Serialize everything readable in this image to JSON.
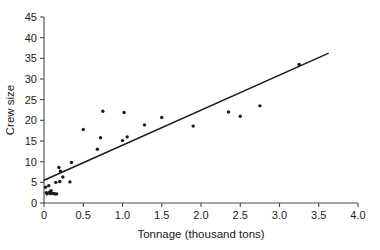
{
  "chart_data": {
    "type": "scatter",
    "title": "",
    "xlabel": "Tonnage (thousand tons)",
    "ylabel": "Crew size",
    "xlim": [
      0,
      4.0
    ],
    "ylim": [
      0,
      45
    ],
    "xticks": [
      0,
      0.5,
      1.0,
      1.5,
      2.0,
      2.5,
      3.0,
      3.5,
      4.0
    ],
    "xticklabels": [
      "0",
      "0.5",
      "1.0",
      "1.5",
      "2.0",
      "2.5",
      "3.0",
      "3.5",
      "4.0"
    ],
    "yticks": [
      0,
      5,
      10,
      15,
      20,
      25,
      30,
      35,
      40,
      45
    ],
    "yticklabels": [
      "0",
      "5",
      "10",
      "15",
      "20",
      "25",
      "30",
      "35",
      "40",
      "45"
    ],
    "grid": false,
    "legend": false,
    "points": [
      [
        0.02,
        3.8
      ],
      [
        0.03,
        2.5
      ],
      [
        0.04,
        2.2
      ],
      [
        0.06,
        4.2
      ],
      [
        0.07,
        2.6
      ],
      [
        0.08,
        2.3
      ],
      [
        0.09,
        3.0
      ],
      [
        0.1,
        2.4
      ],
      [
        0.12,
        2.3
      ],
      [
        0.14,
        2.2
      ],
      [
        0.15,
        5.0
      ],
      [
        0.16,
        2.2
      ],
      [
        0.19,
        8.6
      ],
      [
        0.2,
        5.2
      ],
      [
        0.21,
        7.7
      ],
      [
        0.24,
        6.3
      ],
      [
        0.33,
        5.1
      ],
      [
        0.35,
        9.8
      ],
      [
        0.5,
        17.8
      ],
      [
        0.68,
        13.0
      ],
      [
        0.72,
        15.8
      ],
      [
        0.75,
        22.2
      ],
      [
        1.0,
        15.1
      ],
      [
        1.02,
        21.9
      ],
      [
        1.06,
        16.0
      ],
      [
        1.28,
        18.9
      ],
      [
        1.5,
        20.7
      ],
      [
        1.9,
        18.6
      ],
      [
        2.35,
        22.0
      ],
      [
        2.5,
        21.0
      ],
      [
        2.75,
        23.5
      ],
      [
        3.25,
        33.5
      ]
    ],
    "trend_line": {
      "x": [
        0,
        3.62
      ],
      "y": [
        5.5,
        36.2
      ]
    },
    "marker_size": 1.7,
    "point_color": "#1a1a1a",
    "line_color": "#1a1a1a",
    "axis_color": "#4a4a4a",
    "background": "#ffffff"
  }
}
